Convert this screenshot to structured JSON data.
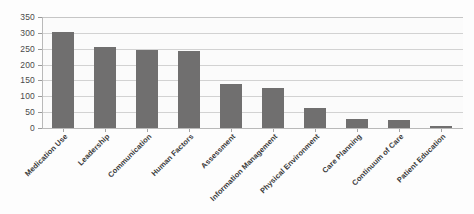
{
  "chart_data": {
    "type": "bar",
    "title": "",
    "xlabel": "",
    "ylabel": "",
    "ylim": [
      0,
      350
    ],
    "yticks": [
      0,
      50,
      100,
      150,
      200,
      250,
      300,
      350
    ],
    "grid": true,
    "legend": false,
    "bar_color": "#706f6f",
    "categories": [
      "Medication Use",
      "Leadership",
      "Communication",
      "Human Factors",
      "Assessment",
      "Information Management",
      "Physical Environment",
      "Care Planning",
      "Continuum of Care",
      "Patient Education"
    ],
    "values": [
      303,
      257,
      245,
      244,
      139,
      125,
      64,
      30,
      26,
      5
    ]
  }
}
